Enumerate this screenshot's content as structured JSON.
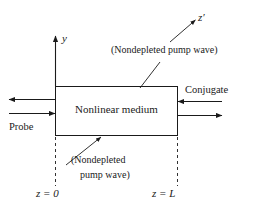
{
  "figure": {
    "line_color": "#1a1a1a",
    "background_color": "#ffffff"
  },
  "box": {
    "label": "Nonlinear medium"
  },
  "axes": {
    "y_label": "y",
    "z_prime_label": "z′"
  },
  "beams": {
    "probe_label": "Probe",
    "conjugate_label": "Conjugate"
  },
  "annotations": {
    "pump_top": "(Nondepleted pump wave)",
    "pump_bottom_line1": "(Nondepleted",
    "pump_bottom_line2": "pump wave)"
  },
  "markers": {
    "z_start": "z = 0",
    "z_end": "z = L"
  }
}
